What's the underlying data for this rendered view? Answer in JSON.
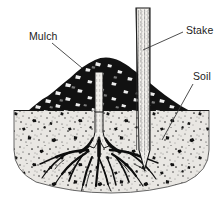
{
  "figure": {
    "type": "line-art-diagram",
    "width": 223,
    "height": 201,
    "background_color": "#ffffff"
  },
  "labels": [
    {
      "id": "mulch",
      "text": "Mulch",
      "text_x": 29,
      "text_y": 40,
      "leader": "M 52 43 L 82 68",
      "describes": "dark chunky mound of mulch heaped around the trunk base"
    },
    {
      "id": "stake",
      "text": "Stake",
      "text_x": 186,
      "text_y": 34,
      "leader": "M 183 32 L 143 50",
      "describes": "vertical wooden support stake driven into the ground"
    },
    {
      "id": "soil",
      "text": "Soil",
      "text_x": 193,
      "text_y": 80,
      "leader": "M 193 84 L 162 140",
      "describes": "stippled soil body shown in cut-away section"
    }
  ],
  "elements": {
    "mulch": {
      "name": "mulch-mound",
      "color": "#111111",
      "ground_line_y": 110,
      "peak_y": 58
    },
    "soil": {
      "name": "soil-block",
      "fill_color": "#e9e7e3",
      "speckle_color": "#1a1a1a",
      "top_y": 110,
      "bottom_y": 191
    },
    "stake": {
      "name": "support-stake",
      "fill_color": "#f2f0ec",
      "outline_color": "#1a1a1a",
      "top_y": 8,
      "tip_y": 170,
      "center_x": 143
    },
    "trunk": {
      "name": "tree-trunk",
      "fill_color": "#f0eeea",
      "outline_color": "#1a1a1a",
      "center_x": 99,
      "top_y": 72,
      "crown_y": 150
    },
    "roots": {
      "name": "root-system",
      "color": "#0d0d0d",
      "crown_x": 99,
      "crown_y": 150
    }
  },
  "colors": {
    "ink": "#1a1a1a",
    "soil_fill": "#e9e7e3",
    "mulch_dark": "#111111",
    "paper": "#ffffff",
    "leader_line": "#3a3a3a"
  }
}
